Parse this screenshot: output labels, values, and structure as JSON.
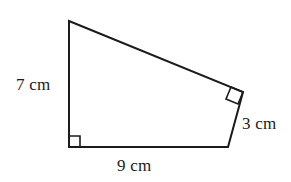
{
  "figure": {
    "name": "right-trapezoid-quadrilateral",
    "background_color": "#ffffff",
    "stroke_color": "#1b1b1b",
    "stroke_width": 2,
    "vertices": {
      "top_left": {
        "x": 69,
        "y": 21
      },
      "top_right": {
        "x": 243,
        "y": 92
      },
      "bottom_right": {
        "x": 228,
        "y": 147
      },
      "bottom_left": {
        "x": 69,
        "y": 147
      }
    },
    "outline_points": "69,21 243,92 228,147 69,147",
    "sides": [
      {
        "id": "left",
        "label": "7 cm",
        "value": 7,
        "unit": "cm",
        "from": "top_left",
        "to": "bottom_left"
      },
      {
        "id": "bottom",
        "label": "9 cm",
        "value": 9,
        "unit": "cm",
        "from": "bottom_left",
        "to": "bottom_right"
      },
      {
        "id": "right",
        "label": "3 cm",
        "value": 3,
        "unit": "cm",
        "from": "top_right",
        "to": "bottom_right"
      },
      {
        "id": "top",
        "label": "",
        "value": null,
        "unit": "cm",
        "from": "top_left",
        "to": "top_right"
      }
    ],
    "right_angle_markers": [
      {
        "id": "bottom-left-right-angle",
        "at": "bottom_left",
        "points": "69,136 80,136 80,147 69,147"
      },
      {
        "id": "top-right-right-angle",
        "at": "top_right",
        "points": "243,92 231,87 226,99 238,104"
      }
    ],
    "labels": {
      "left": "7 cm",
      "right": "3 cm",
      "bottom": "9 cm"
    }
  }
}
